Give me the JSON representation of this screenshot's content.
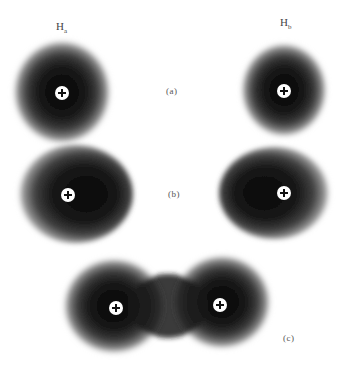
{
  "diagram": {
    "atoms": [
      {
        "symbol": "H",
        "subscript": "a"
      },
      {
        "symbol": "H",
        "subscript": "b"
      }
    ],
    "panels": [
      {
        "label": "(a)",
        "description": "Two separated hydrogen atoms with spherical electron clouds"
      },
      {
        "label": "(b)",
        "description": "Atoms approaching; electron clouds polarized toward each other"
      },
      {
        "label": "(c)",
        "description": "Overlapping electron clouds forming the H2 bond"
      }
    ],
    "nucleus_symbol": "+",
    "colors": {
      "cloud_core": "#0d0d0d",
      "cloud_edge": "#9a9a9a",
      "background": "#ffffff",
      "nucleus": "#ffffff"
    }
  }
}
